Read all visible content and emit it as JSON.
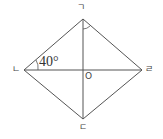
{
  "diagram": {
    "type": "rhombus",
    "vertices": {
      "top": {
        "label": "ㄱ",
        "x": 83,
        "y": 19
      },
      "left": {
        "label": "ㄴ",
        "x": 24,
        "y": 70
      },
      "bottom": {
        "label": "ㄷ",
        "x": 83,
        "y": 119
      },
      "right": {
        "label": "ㄹ",
        "x": 142,
        "y": 70
      }
    },
    "center": {
      "label": "O",
      "x": 83,
      "y": 70
    },
    "angle_label": "40°",
    "stroke_color": "#555555"
  }
}
